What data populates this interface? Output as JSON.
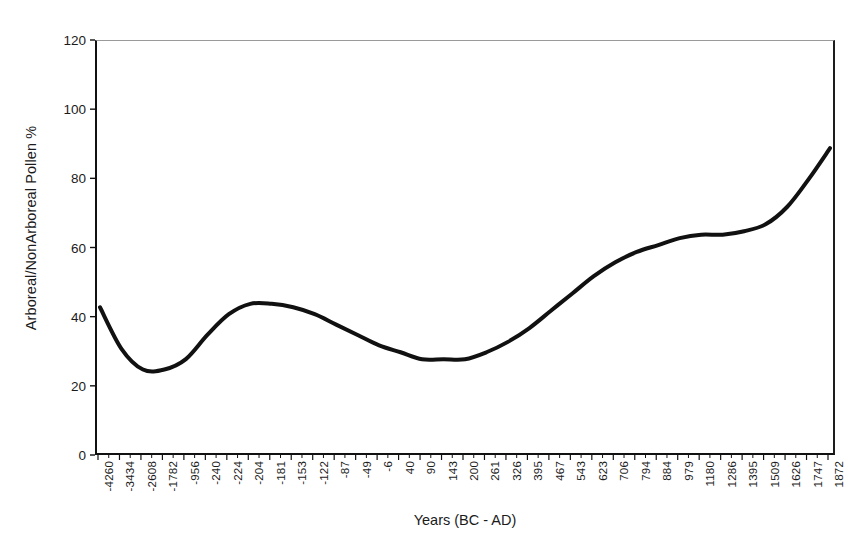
{
  "chart_data": {
    "type": "line",
    "title": "",
    "xlabel": "Years (BC - AD)",
    "ylabel": "Arboreal/NonArboreal Pollen %",
    "ylim": [
      0,
      120
    ],
    "ytick_labels": [
      "0",
      "20",
      "40",
      "60",
      "80",
      "100",
      "120"
    ],
    "ytick_values": [
      0,
      20,
      40,
      60,
      80,
      100,
      120
    ],
    "grid": false,
    "legend": "none",
    "categories": [
      "-4260",
      "-3434",
      "-2608",
      "-1782",
      "-956",
      "-240",
      "-224",
      "-204",
      "-181",
      "-153",
      "-122",
      "-87",
      "-49",
      "-6",
      "40",
      "90",
      "143",
      "200",
      "261",
      "326",
      "395",
      "467",
      "543",
      "623",
      "706",
      "794",
      "884",
      "979",
      "1180",
      "1286",
      "1395",
      "1509",
      "1626",
      "1747",
      "1872"
    ],
    "x_values": [
      -4260,
      -3434,
      -2608,
      -1782,
      -956,
      -240,
      -224,
      -204,
      -181,
      -153,
      -122,
      -87,
      -49,
      -6,
      40,
      90,
      143,
      200,
      261,
      326,
      395,
      467,
      543,
      623,
      706,
      794,
      884,
      979,
      1180,
      1286,
      1395,
      1509,
      1626,
      1747,
      1872
    ],
    "series": [
      {
        "name": "Arboreal/NonArboreal Pollen %",
        "color": "#111111",
        "values": [
          43,
          31,
          25,
          25,
          28,
          35,
          41,
          44,
          44,
          43,
          41,
          38,
          35,
          32,
          30,
          28,
          28,
          28,
          30,
          33,
          37,
          42,
          47,
          52,
          56,
          59,
          61,
          63,
          64,
          64,
          65,
          67,
          72,
          80,
          89
        ]
      }
    ],
    "annotations": {
      "start_value": 43,
      "first_minimum": 25,
      "local_peak": 44,
      "second_minimum": 28,
      "plateau_value": 64,
      "end_value": 89
    }
  },
  "colors": {
    "curve": "#111111",
    "axis": "#111111",
    "frame_top": "#9a9a9a",
    "background": "#ffffff",
    "text": "#1b1b1b"
  }
}
